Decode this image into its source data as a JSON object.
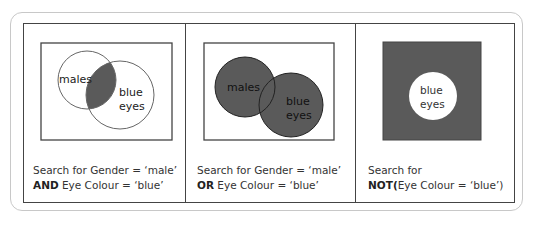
{
  "colors": {
    "fill": "#5a5a5a",
    "line": "#444444",
    "frame": "#c8c8c8",
    "text": "#333333"
  },
  "panels": [
    {
      "operator": "AND",
      "venn_labels": [
        "males",
        "blue",
        "eyes"
      ],
      "caption_line1": "Search for Gender = ‘male’",
      "caption_bold": "AND",
      "caption_line2": " Eye Colour = ‘blue’"
    },
    {
      "operator": "OR",
      "venn_labels": [
        "males",
        "blue",
        "eyes"
      ],
      "caption_line1": "Search for Gender = ‘male’",
      "caption_bold": "OR",
      "caption_line2": " Eye Colour = ‘blue’"
    },
    {
      "operator": "NOT",
      "venn_labels": [
        "blue",
        "eyes"
      ],
      "caption_line1": "Search for",
      "caption_bold": "NOT(",
      "caption_line2": "Eye Colour = ‘blue’)"
    }
  ]
}
